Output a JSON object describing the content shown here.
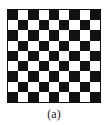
{
  "figure": {
    "caption": "(a)",
    "board": {
      "rows": 9,
      "cols": 9,
      "top_left": "dark",
      "colors": {
        "dark": "#111111",
        "light": "#ffffff"
      }
    }
  }
}
